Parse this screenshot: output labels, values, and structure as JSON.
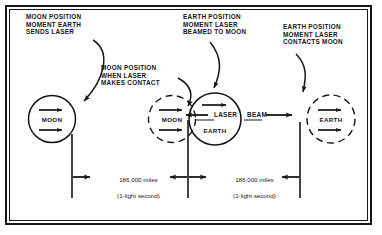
{
  "figure": {
    "ink_color": "#16161a",
    "background": "#ffffff"
  },
  "callouts": [
    {
      "id": "moon-position-sends-laser",
      "text": "MOON POSITION\nMOMENT EARTH\nSENDS LASER"
    },
    {
      "id": "moon-position-makes-contact",
      "text": "MOON POSITION\nWHEN LASER\nMAKES CONTACT"
    },
    {
      "id": "earth-position-beamed-to-moon",
      "text": "EARTH POSITION\nMOMENT LASER\nBEAMED TO MOON"
    },
    {
      "id": "earth-position-contacts-moon",
      "text": "EARTH POSITION\nMOMENT LASER\nCONTACTS MOON"
    }
  ],
  "bodies": [
    {
      "id": "moon-start",
      "label": "MOON",
      "style": "solid"
    },
    {
      "id": "moon-later",
      "label": "MOON",
      "style": "dashed"
    },
    {
      "id": "earth-start",
      "label": "EARTH",
      "style": "solid"
    },
    {
      "id": "earth-later",
      "label": "EARTH",
      "style": "dashed"
    }
  ],
  "beam": {
    "word_left": "LASER",
    "word_right": "BEAM"
  },
  "measurements": [
    {
      "id": "span-left",
      "distance": "186,000 miles",
      "time": "(1-light second)"
    },
    {
      "id": "span-right",
      "distance": "186,000 miles",
      "time": "(1-light second)"
    }
  ]
}
